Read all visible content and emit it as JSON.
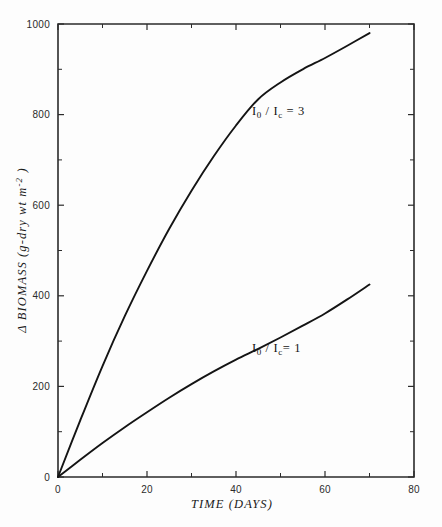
{
  "figure": {
    "background_color": "#fdfdfd",
    "line_color": "#141414",
    "axis_color": "#2b2b2b"
  },
  "axes": {
    "x_title": "TIME (DAYS)",
    "y_title_parts": {
      "delta": "Δ",
      "main": " BIOMASS  (g-dry wt  m",
      "exponent": "-2",
      "close": " )"
    },
    "x_tick_labels": [
      "0",
      "20",
      "40",
      "60",
      "80"
    ],
    "y_tick_labels": [
      "0",
      "200",
      "400",
      "600",
      "800",
      "1000"
    ]
  },
  "annotations": {
    "upper_curve": {
      "symbol": "I",
      "sub1": "0",
      "slash": " / I",
      "sub2": "c",
      "equals": " = 3"
    },
    "lower_curve": {
      "symbol": "I",
      "sub1": "0",
      "slash": " / I",
      "sub2": "c",
      "equals": "= 1"
    }
  },
  "chart_data": {
    "type": "line",
    "title": "",
    "xlabel": "TIME (DAYS)",
    "ylabel": "Δ BIOMASS (g-dry wt m-2)",
    "xlim": [
      0,
      80
    ],
    "ylim": [
      0,
      1000
    ],
    "xticks": [
      0,
      20,
      40,
      60,
      80
    ],
    "yticks": [
      0,
      200,
      400,
      600,
      800,
      1000
    ],
    "x_minor_ticks": [
      10,
      30,
      50,
      70
    ],
    "y_minor_ticks": [
      100,
      300,
      500,
      700,
      900
    ],
    "grid": false,
    "legend": "inline-annotations",
    "x": [
      0,
      5,
      10,
      15,
      20,
      25,
      30,
      35,
      40,
      45,
      50,
      55,
      60,
      65,
      70
    ],
    "series": [
      {
        "name": "I0/Ic = 3",
        "label": "I₀ / Iᴄ = 3",
        "values": [
          0,
          125,
          245,
          355,
          455,
          548,
          632,
          708,
          776,
          834,
          871,
          900,
          925,
          952,
          980
        ]
      },
      {
        "name": "I0/Ic = 1",
        "label": "I₀ / Iᴄ = 1",
        "values": [
          0,
          38,
          75,
          110,
          143,
          175,
          205,
          233,
          259,
          283,
          308,
          334,
          361,
          392,
          425
        ]
      }
    ]
  }
}
